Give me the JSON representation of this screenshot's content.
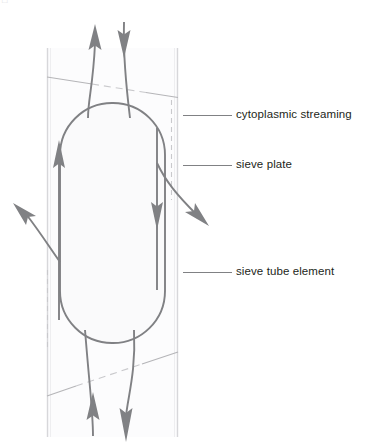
{
  "figure": {
    "background_color": "#ffffff",
    "width": 366,
    "height": 447
  },
  "colors": {
    "arrow": "#808184",
    "cell_outline": "#808184",
    "tube_wall": "#d7d7da",
    "sieve_plate_line": "#b5b5b8",
    "sieve_plate_dash": "#c9c9cc",
    "cell_fill": "#fafafb",
    "tube_fill": "#fcfcfd",
    "leader_line": "#808184",
    "label_text": "#231f20"
  },
  "labels": [
    {
      "id": "cytoplasmic-streaming",
      "text": "cytoplasmic streaming",
      "leader_y": 115,
      "leader_x_start": 183,
      "leader_x_end": 232
    },
    {
      "id": "sieve-plate",
      "text": "sieve plate",
      "leader_y": 165,
      "leader_x_start": 183,
      "leader_x_end": 232
    },
    {
      "id": "sieve-tube-element",
      "text": "sieve tube element",
      "leader_y": 272,
      "leader_x_start": 183,
      "leader_x_end": 232
    }
  ],
  "tube": {
    "left_wall_x": 47,
    "right_wall_x": 178,
    "top_y": 48,
    "bottom_y": 437
  },
  "sieve_plates": [
    {
      "id": "top-sieve-plate",
      "x1": 47,
      "y1": 77,
      "x2": 178,
      "y2": 97,
      "dashed_segment": {
        "x1": 88,
        "x2": 148
      }
    },
    {
      "id": "bottom-sieve-plate",
      "x1": 47,
      "y1": 396,
      "x2": 178,
      "y2": 352,
      "dashed_segment": {
        "x1": 72,
        "x2": 140
      }
    }
  ],
  "cell_body": {
    "left_x": 60,
    "right_x": 165,
    "top_y": 103,
    "bottom_y": 343,
    "corner_radius": 52
  },
  "flow_arrows": [
    {
      "id": "top-out-arrow",
      "direction": "up",
      "description": "flow exiting upward through top sieve plate"
    },
    {
      "id": "top-in-arrow",
      "direction": "down",
      "description": "flow entering downward through top sieve plate"
    },
    {
      "id": "interior-up-arrow",
      "direction": "up",
      "description": "streaming up the left side of the element"
    },
    {
      "id": "interior-down-arrow",
      "direction": "down",
      "description": "streaming down the right side of the element"
    },
    {
      "id": "left-exit-arrow",
      "direction": "up-left",
      "description": "flow exiting through left wall"
    },
    {
      "id": "right-exit-arrow",
      "direction": "down-right",
      "description": "flow exiting through right wall"
    },
    {
      "id": "bottom-in-arrow",
      "direction": "up",
      "description": "flow entering upward through bottom sieve plate"
    },
    {
      "id": "bottom-out-arrow",
      "direction": "down",
      "description": "flow exiting downward through bottom sieve plate"
    }
  ]
}
